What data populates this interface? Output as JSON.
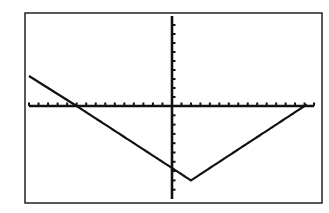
{
  "chart_data": {
    "type": "line",
    "title": "",
    "xlabel": "",
    "ylabel": "",
    "function": "y = (2/3)|x - 2| - 8",
    "xlim": [
      -15,
      15
    ],
    "ylim": [
      -10,
      10
    ],
    "xscl": 1,
    "yscl": 1,
    "grid": false,
    "series": [
      {
        "name": "Y1",
        "x": [
          -15,
          -10,
          0,
          2,
          14,
          15
        ],
        "y": [
          3.33,
          0,
          -6.67,
          -8,
          0,
          0.67
        ]
      }
    ],
    "key_points": {
      "vertex": [
        2,
        -8
      ],
      "y_intercept": [
        0,
        -6.67
      ],
      "x_intercepts": [
        -10,
        14
      ]
    }
  },
  "style": {
    "frame_color": "#222222",
    "axis_color": "#111111",
    "line_color": "#111111",
    "background": "#ffffff"
  }
}
